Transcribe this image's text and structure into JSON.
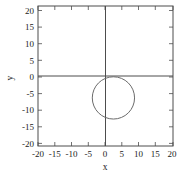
{
  "figure": {
    "background_color": "#ffffff",
    "frame_color": "#4d4d4d",
    "axis_color": "#4d4d4d",
    "curve_color": "#6b6b6b",
    "text_color": "#222222"
  },
  "chart_data": {
    "type": "line",
    "title": "",
    "subtitle": "",
    "xlabel": "x",
    "ylabel": "y",
    "xlim": [
      -23,
      23
    ],
    "ylim": [
      -23,
      23
    ],
    "grid": false,
    "legend": null,
    "xticks": [
      -20,
      -15,
      -10,
      -5,
      0,
      5,
      10,
      15,
      20
    ],
    "xticklabels": [
      "-20",
      "-15",
      "-10",
      "-5",
      "0",
      "5",
      "10",
      "15",
      "20"
    ],
    "yticks": [
      20,
      15,
      10,
      5,
      0,
      -5,
      -10,
      -15,
      -20
    ],
    "yticklabels": [
      "20",
      "15",
      "10",
      "5",
      "0",
      "-5",
      "-10",
      "-15",
      "-20"
    ],
    "axes_through_origin": true,
    "series": [
      {
        "name": "circle",
        "shape": "circle",
        "center_x": 2.7,
        "center_y": -7.2,
        "radius": 7.2
      }
    ]
  }
}
